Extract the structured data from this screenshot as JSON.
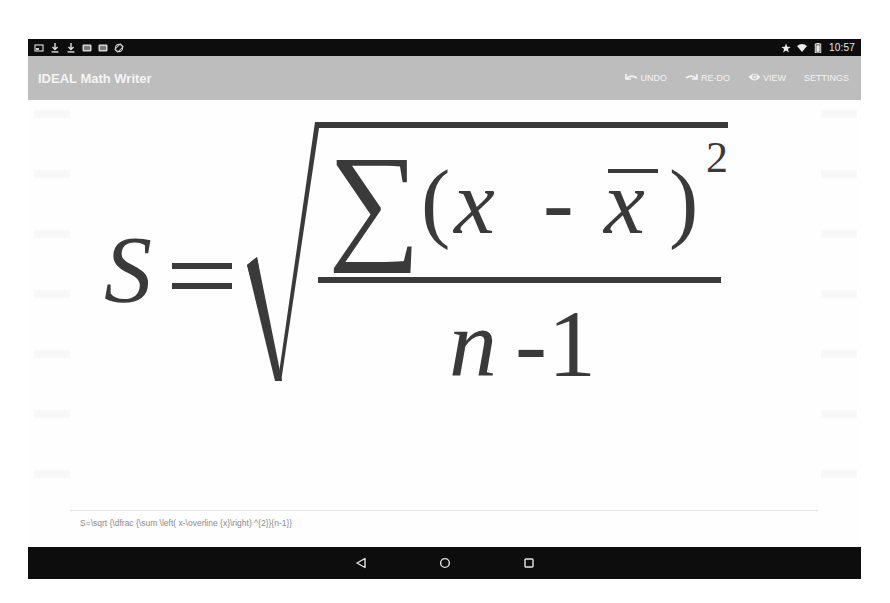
{
  "status_bar": {
    "left_icons": [
      "screenshot-icon",
      "download-icon",
      "download-icon",
      "photo-icon",
      "photo-icon",
      "screen-rotation-icon"
    ],
    "right_icons": [
      "star-icon",
      "wifi-icon",
      "battery-icon"
    ],
    "time": "10:57"
  },
  "app_bar": {
    "title": "IDEAL Math Writer",
    "actions": [
      {
        "label": "UNDO",
        "icon": "undo-icon"
      },
      {
        "label": "RE-DO",
        "icon": "redo-icon"
      },
      {
        "label": "VIEW",
        "icon": "eye-icon"
      },
      {
        "label": "SETTINGS",
        "icon": ""
      }
    ]
  },
  "formula": {
    "lhs": "S",
    "equals": "=",
    "sum": "∑",
    "open_paren": "(",
    "x": "x",
    "minus": "-",
    "x_bar": "x",
    "close_paren": ")",
    "exponent": "2",
    "denominator_n": "n",
    "denominator_minus": "-",
    "denominator_one": "1"
  },
  "latex_source": "S=\\sqrt {\\dfrac {\\sum \\left( x-\\overline {x}\\right) ^{2}}{n-1}}",
  "colors": {
    "status_bar": "#0d0d0d",
    "app_bar": "#bdbdbd",
    "formula_ink": "#3a3a3a",
    "nav_bar": "#0d0d0d"
  },
  "nav_bar": {
    "buttons": [
      "back",
      "home",
      "recents"
    ]
  }
}
